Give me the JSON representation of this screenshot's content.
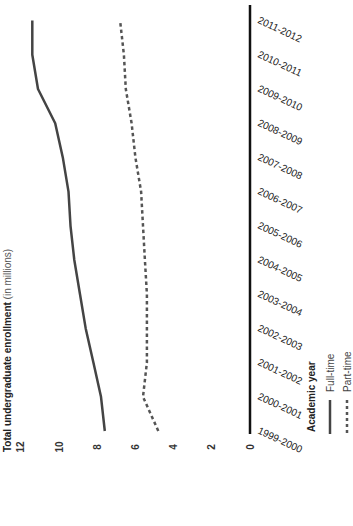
{
  "chart_data": {
    "type": "line",
    "orientation": "rotated-90-ccw",
    "title": "",
    "ylabel": "Total undergraduate enrollment (in millions)",
    "ylabel_bold": "Total undergraduate enrollment",
    "ylabel_unit": "(in millions)",
    "xlabel": "Academic year",
    "categories": [
      "1999-2000",
      "2000-2001",
      "2001-2002",
      "2002-2003",
      "2003-2004",
      "2004-2005",
      "2005-2006",
      "2006-2007",
      "2007-2008",
      "2008-2009",
      "2009-2010",
      "2010-2011",
      "2011-2012"
    ],
    "series": [
      {
        "name": "Full-time",
        "style": "solid",
        "color": "#444444",
        "values": [
          7.6,
          7.8,
          8.2,
          8.6,
          8.9,
          9.2,
          9.4,
          9.5,
          9.8,
          10.2,
          11.1,
          11.4,
          11.4
        ]
      },
      {
        "name": "Part-time",
        "style": "dashed",
        "color": "#555555",
        "values": [
          4.8,
          5.6,
          5.4,
          5.4,
          5.4,
          5.5,
          5.6,
          5.7,
          6.0,
          6.2,
          6.5,
          6.6,
          6.8
        ]
      }
    ],
    "ylim": [
      0,
      12
    ],
    "yticks": [
      "0",
      "2",
      "4",
      "6",
      "8",
      "10",
      "12"
    ],
    "grid": false,
    "legend": {
      "title": "Academic year",
      "position": "bottom-right",
      "entries": [
        "Full-time",
        "Part-time"
      ]
    }
  },
  "axis": {
    "title": "Total undergraduate enrollment (in millions)"
  },
  "legend": {
    "title": "Academic year",
    "full_time": "Full-time",
    "part_time": "Part-time"
  },
  "colors": {
    "axis": "#111111",
    "full_time": "#444444",
    "part_time": "#555555"
  }
}
